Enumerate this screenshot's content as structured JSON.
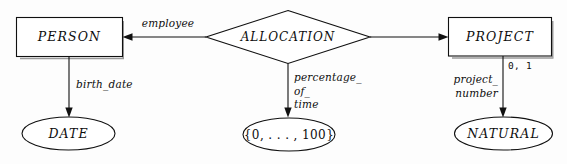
{
  "diagram": {
    "kind": "entity-relationship-diagram",
    "background_color": "#fdfdfd",
    "stroke_color": "#101010",
    "shadow_color": "#9a9a9a",
    "entities": [
      {
        "id": "person",
        "label": "PERSON",
        "shape": "rectangle"
      },
      {
        "id": "project",
        "label": "PROJECT",
        "shape": "rectangle"
      }
    ],
    "relationships": [
      {
        "id": "allocation",
        "label": "ALLOCATION",
        "shape": "diamond"
      }
    ],
    "value_sets": [
      {
        "id": "date",
        "label": "DATE",
        "shape": "ellipse"
      },
      {
        "id": "percent",
        "label": "{0, . . . , 100}",
        "shape": "ellipse"
      },
      {
        "id": "natural",
        "label": "NATURAL",
        "shape": "ellipse"
      }
    ],
    "role_labels": [
      {
        "id": "employee",
        "label": "employee",
        "from": "allocation",
        "to": "person"
      }
    ],
    "attribute_labels": [
      {
        "id": "birth-date",
        "lines": [
          "birth_date"
        ],
        "from": "person",
        "to": "date"
      },
      {
        "id": "percentage-of-time",
        "lines": [
          "percentage_",
          "of_",
          "time"
        ],
        "from": "allocation",
        "to": "percent"
      },
      {
        "id": "project-number",
        "lines": [
          "project_",
          "number"
        ],
        "from": "project",
        "to": "natural"
      }
    ],
    "cardinality_labels": [
      {
        "id": "project-number-cardinality",
        "label": "0, 1",
        "on": "project-number"
      }
    ]
  }
}
